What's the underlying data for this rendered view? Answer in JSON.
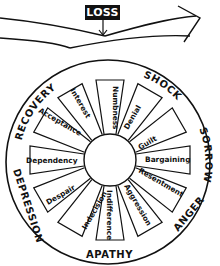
{
  "header": {
    "loss_label": "LOSS"
  },
  "wheel": {
    "stages": [
      {
        "id": "shock",
        "label": "SHOCK"
      },
      {
        "id": "sorrow",
        "label": "SORROW"
      },
      {
        "id": "anger",
        "label": "ANGER"
      },
      {
        "id": "apathy",
        "label": "APATHY"
      },
      {
        "id": "depression",
        "label": "DEPRESSION"
      },
      {
        "id": "recovery",
        "label": "RECOVERY"
      }
    ],
    "spokes": [
      {
        "id": "numbness",
        "label": "Numbness"
      },
      {
        "id": "denial",
        "label": "Denial"
      },
      {
        "id": "guilt",
        "label": "Guilt"
      },
      {
        "id": "bargaining",
        "label": "Bargaining"
      },
      {
        "id": "resentment",
        "label": "Resentment"
      },
      {
        "id": "aggression",
        "label": "Aggression"
      },
      {
        "id": "indifference",
        "label": "Indifference"
      },
      {
        "id": "indecision",
        "label": "Indecision"
      },
      {
        "id": "despair",
        "label": "Despair"
      },
      {
        "id": "dependency",
        "label": "Dependency"
      },
      {
        "id": "acceptance",
        "label": "Acceptance"
      },
      {
        "id": "interest",
        "label": "Interest"
      }
    ]
  },
  "colors": {
    "ink": "#111111",
    "background": "#ffffff"
  }
}
